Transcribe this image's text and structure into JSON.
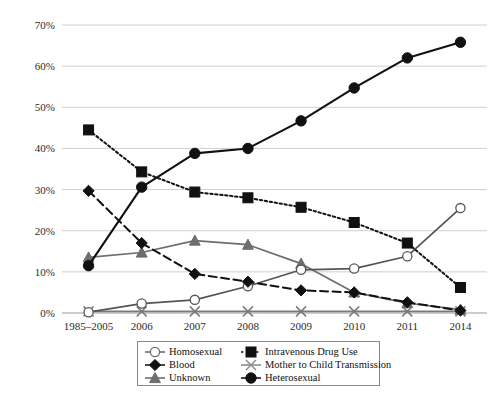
{
  "chart_data": {
    "type": "line",
    "title": "",
    "subtitle": "",
    "xlabel": "",
    "ylabel": "",
    "grid": true,
    "legend_position": "bottom",
    "categories": [
      "1985–2005",
      "2006",
      "2007",
      "2008",
      "2009",
      "2010",
      "2011",
      "2014"
    ],
    "ylim": [
      0,
      70
    ],
    "yticks": [
      0,
      10,
      20,
      30,
      40,
      50,
      60,
      70
    ],
    "ytick_labels": [
      "0%",
      "10%",
      "20%",
      "30%",
      "40%",
      "50%",
      "60%",
      "70%"
    ],
    "series": [
      {
        "name": "Homosexual",
        "marker": "open-circle",
        "line": "solid",
        "color": "#555555",
        "values": [
          0.2,
          2.3,
          3.2,
          6.5,
          10.5,
          10.8,
          13.8,
          25.5
        ]
      },
      {
        "name": "Intravenous Drug Use",
        "marker": "filled-square",
        "line": "dotted",
        "color": "#111111",
        "values": [
          44.5,
          34.3,
          29.4,
          28.0,
          25.7,
          22.0,
          17.0,
          6.2
        ]
      },
      {
        "name": "Blood",
        "marker": "filled-diamond",
        "line": "dashed",
        "color": "#111111",
        "values": [
          29.7,
          17.0,
          9.5,
          7.6,
          5.5,
          5.0,
          2.6,
          0.6
        ]
      },
      {
        "name": "Mother to Child Transmission",
        "marker": "cross-x",
        "line": "solid",
        "color": "#7a7a7a",
        "values": [
          0.4,
          0.4,
          0.4,
          0.4,
          0.4,
          0.4,
          0.4,
          0.4
        ]
      },
      {
        "name": "Unknown",
        "marker": "filled-triangle",
        "line": "solid",
        "color": "#6e6e6e",
        "values": [
          13.5,
          14.7,
          17.6,
          16.6,
          12.0,
          5.0,
          2.4,
          0.8
        ]
      },
      {
        "name": "Heterosexual",
        "marker": "filled-circle",
        "line": "solid",
        "color": "#111111",
        "values": [
          11.5,
          30.6,
          38.8,
          40.0,
          46.7,
          54.7,
          62.0,
          65.8
        ]
      }
    ]
  },
  "legend": {
    "entries": [
      {
        "label": "Homosexual"
      },
      {
        "label": "Intravenous Drug Use"
      },
      {
        "label": "Blood"
      },
      {
        "label": "Mother to Child Transmission"
      },
      {
        "label": "Unknown"
      },
      {
        "label": "Heterosexual"
      }
    ]
  },
  "axes": {
    "y_labels": [
      "70%",
      "60%",
      "50%",
      "40%",
      "30%",
      "20%",
      "10%",
      "0%"
    ],
    "x_labels": [
      "1985–2005",
      "2006",
      "2007",
      "2008",
      "2009",
      "2010",
      "2011",
      "2014"
    ]
  },
  "colors": {
    "grid": "#c9c9c9",
    "axis": "#9a9a9a",
    "dark": "#111111",
    "gray": "#6e6e6e",
    "light_gray": "#8d8d8d"
  }
}
